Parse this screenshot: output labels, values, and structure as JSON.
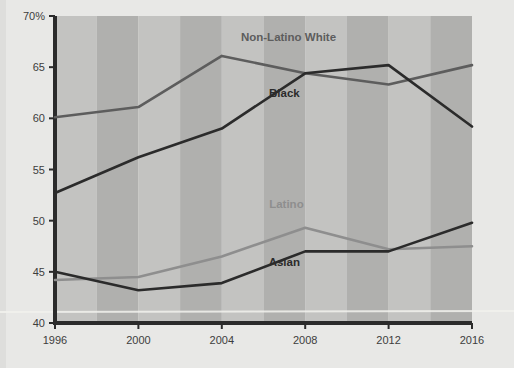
{
  "chart_data": {
    "type": "line",
    "title": "",
    "subtitle": "",
    "xlabel": "",
    "ylabel": "",
    "x": [
      1996,
      2000,
      2004,
      2008,
      2012,
      2016
    ],
    "categories": [
      "1996",
      "2000",
      "2004",
      "2008",
      "2012",
      "2016"
    ],
    "xlim": [
      1996,
      2016
    ],
    "ylim": [
      40,
      70
    ],
    "y_ticks": [
      40,
      45,
      50,
      55,
      60,
      65,
      70
    ],
    "y_tick_labels": [
      "40",
      "45",
      "50",
      "55",
      "60",
      "65",
      "70%"
    ],
    "x_ticks": [
      1996,
      2000,
      2004,
      2008,
      2012,
      2016
    ],
    "x_tick_labels": [
      "1996",
      "2000",
      "2004",
      "2008",
      "2012",
      "2016"
    ],
    "grid": false,
    "legend": "inline-labels",
    "series": [
      {
        "name": "Non-Latino White",
        "color": "#5d5d5d",
        "values": [
          60.1,
          61.1,
          66.1,
          64.4,
          63.3,
          65.2
        ],
        "label_x": 2007.2,
        "label_y": 67.6,
        "label_anchor": "middle"
      },
      {
        "name": "Black",
        "color": "#2b2b2b",
        "values": [
          52.7,
          56.2,
          59.0,
          64.4,
          65.2,
          59.2
        ],
        "label_x": 2007.0,
        "label_y": 62.1,
        "label_anchor": "middle"
      },
      {
        "name": "Latino",
        "color": "#8e8e8e",
        "values": [
          44.2,
          44.5,
          46.5,
          49.3,
          47.2,
          47.5
        ],
        "label_x": 2007.1,
        "label_y": 51.2,
        "label_anchor": "middle"
      },
      {
        "name": "Asian",
        "color": "#2b2b2b",
        "values": [
          45.0,
          43.2,
          43.9,
          47.0,
          47.0,
          49.8
        ],
        "label_x": 2007.0,
        "label_y": 45.6,
        "label_anchor": "middle"
      }
    ],
    "bands": [
      {
        "from": 1996,
        "to": 1998,
        "shade": "light"
      },
      {
        "from": 1998,
        "to": 2000,
        "shade": "dark"
      },
      {
        "from": 2000,
        "to": 2002,
        "shade": "light"
      },
      {
        "from": 2002,
        "to": 2004,
        "shade": "dark"
      },
      {
        "from": 2004,
        "to": 2006,
        "shade": "light"
      },
      {
        "from": 2006,
        "to": 2008,
        "shade": "dark"
      },
      {
        "from": 2008,
        "to": 2010,
        "shade": "light"
      },
      {
        "from": 2010,
        "to": 2012,
        "shade": "dark"
      },
      {
        "from": 2012,
        "to": 2014,
        "shade": "light"
      },
      {
        "from": 2014,
        "to": 2016,
        "shade": "dark"
      }
    ],
    "colors": {
      "page_background": "#e8e8e6",
      "plot_band_light": "#c3c3c1",
      "plot_band_dark": "#b0b0ae",
      "axis": "#2b2b2b",
      "tick_text": "#3d3d3d",
      "highlight_rule": "#f2f2ee"
    }
  }
}
